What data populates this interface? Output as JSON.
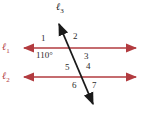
{
  "diagram": {
    "lines": {
      "l1": {
        "base": "ℓ",
        "sub": "1"
      },
      "l2": {
        "base": "ℓ",
        "sub": "2"
      },
      "l3": {
        "base": "ℓ",
        "sub": "3"
      }
    },
    "angles": {
      "a1": "1",
      "a2": "2",
      "a3": "3",
      "a4": "4",
      "a5": "5",
      "a6": "6",
      "a7": "7",
      "measure": "110°"
    },
    "colors": {
      "parallel_lines": "#b23b3f",
      "transversal": "#1a1a1a"
    }
  }
}
